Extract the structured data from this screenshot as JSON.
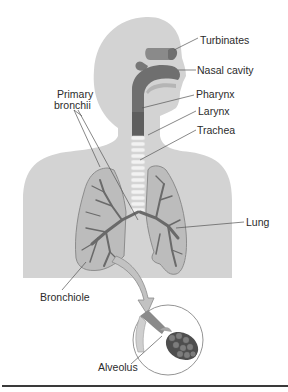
{
  "diagram": {
    "type": "anatomical illustration",
    "labels": {
      "turbinates": "Turbinates",
      "nasal_cavity": "Nasal cavity",
      "pharynx": "Pharynx",
      "larynx": "Larynx",
      "trachea": "Trachea",
      "lung": "Lung",
      "primary_bronchii_line1": "Primary",
      "primary_bronchii_line2": "bronchii",
      "bronchiole": "Bronchiole",
      "alveolus": "Alveolus"
    },
    "colors": {
      "body": "#d2d2d2",
      "airway": "#7a7a7a",
      "lung_fill": "#bdbdbd",
      "lung_branches": "#6e6e6e",
      "leader_lines": "#555555",
      "arrow": "#bfbfbf",
      "rule": "#3a3a3a"
    }
  }
}
